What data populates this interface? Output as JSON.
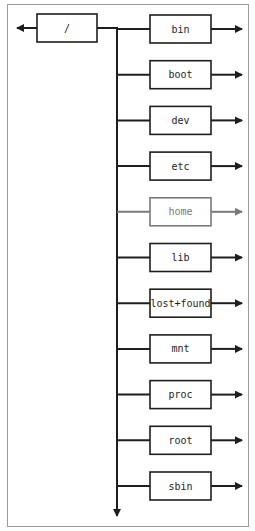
{
  "diagram": {
    "root": {
      "label": "/"
    },
    "children": [
      {
        "label": "bin",
        "highlighted": false
      },
      {
        "label": "boot",
        "highlighted": false
      },
      {
        "label": "dev",
        "highlighted": false
      },
      {
        "label": "etc",
        "highlighted": false
      },
      {
        "label": "home",
        "highlighted": true
      },
      {
        "label": "lib",
        "highlighted": false
      },
      {
        "label": "lost+found",
        "highlighted": false
      },
      {
        "label": "mnt",
        "highlighted": false
      },
      {
        "label": "proc",
        "highlighted": false
      },
      {
        "label": "root",
        "highlighted": false
      },
      {
        "label": "sbin",
        "highlighted": false
      }
    ],
    "colors": {
      "line": "#1e1e1e",
      "highlight": "#7a7a7a",
      "frame": "#9a9a9a"
    }
  }
}
